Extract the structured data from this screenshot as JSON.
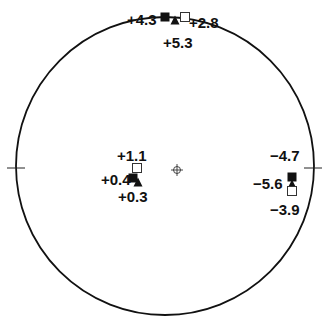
{
  "diagram": {
    "type": "polar-map",
    "circle": {
      "cx": 165,
      "cy": 166,
      "r": 149,
      "stroke": "#111111"
    },
    "center_marker": {
      "x": 177,
      "y": 170,
      "icon": "crosshair-circle-icon"
    },
    "axis_ticks": [
      {
        "name": "left-tick",
        "x": 16,
        "y": 168
      },
      {
        "name": "right-tick",
        "x": 313,
        "y": 168
      }
    ],
    "clusters": [
      {
        "name": "top",
        "labels": [
          {
            "text": "+4.3",
            "x": 127,
            "y": 25
          },
          {
            "text": "+2.8",
            "x": 189,
            "y": 28
          },
          {
            "text": "+5.3",
            "x": 163,
            "y": 48
          }
        ],
        "markers": [
          {
            "shape": "filled-square",
            "x": 165,
            "y": 17,
            "size": 9
          },
          {
            "shape": "filled-triangle",
            "x": 175,
            "y": 20,
            "size": 9
          },
          {
            "shape": "open-square",
            "x": 185,
            "y": 17,
            "size": 9
          }
        ]
      },
      {
        "name": "left",
        "labels": [
          {
            "text": "+1.1",
            "x": 117,
            "y": 161
          },
          {
            "text": "+0.4",
            "x": 101,
            "y": 185
          },
          {
            "text": "+0.3",
            "x": 118,
            "y": 202
          }
        ],
        "markers": [
          {
            "shape": "open-square",
            "x": 137,
            "y": 168,
            "size": 9
          },
          {
            "shape": "filled-square",
            "x": 133,
            "y": 178,
            "size": 9
          },
          {
            "shape": "filled-triangle",
            "x": 138,
            "y": 182,
            "size": 9
          }
        ]
      },
      {
        "name": "right",
        "labels": [
          {
            "text": "-4.7",
            "x": 270,
            "y": 161
          },
          {
            "text": "-5.6",
            "x": 253,
            "y": 189
          },
          {
            "text": "-3.9",
            "x": 270,
            "y": 215
          }
        ],
        "markers": [
          {
            "shape": "filled-square",
            "x": 292,
            "y": 177,
            "size": 9
          },
          {
            "shape": "filled-triangle",
            "x": 292,
            "y": 184,
            "size": 9
          },
          {
            "shape": "open-square",
            "x": 292,
            "y": 191,
            "size": 9
          }
        ]
      }
    ]
  }
}
